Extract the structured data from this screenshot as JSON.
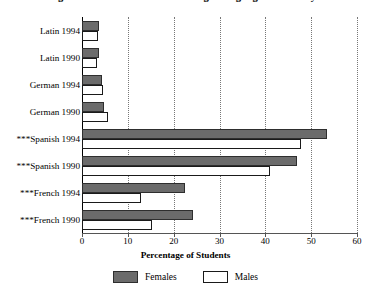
{
  "chart_data": {
    "type": "bar",
    "orientation": "horizontal",
    "title": "Percentage of Students Enrolled in Foreign Language Courses by Gender",
    "xlabel": "Percentage of Students",
    "ylabel": "",
    "xlim": [
      0,
      60
    ],
    "xticks": [
      0,
      10,
      20,
      30,
      40,
      50,
      60
    ],
    "xtick_labels": [
      "0",
      "10",
      "20",
      "30",
      "40",
      "50",
      "60"
    ],
    "grid": "vertical-dotted",
    "legend_position": "bottom-center",
    "categories": [
      "Latin 1994",
      "Latin 1990",
      "German 1994",
      "German 1990",
      "***Spanish 1994",
      "***Spanish 1990",
      "***French 1994",
      "***French 1990"
    ],
    "series": [
      {
        "name": "Females",
        "color": "#6b6b6b",
        "values": [
          3.8,
          3.6,
          4.3,
          4.7,
          53.5,
          46.8,
          22.5,
          24.3
        ]
      },
      {
        "name": "Males",
        "color": "#ffffff",
        "values": [
          3.5,
          3.3,
          4.6,
          5.6,
          47.8,
          41.0,
          12.8,
          15.2
        ]
      }
    ]
  },
  "legend": {
    "entries": [
      {
        "label": "Females",
        "swatch": "filled-gray-swatch"
      },
      {
        "label": "Males",
        "swatch": "outline-white-swatch"
      }
    ]
  }
}
